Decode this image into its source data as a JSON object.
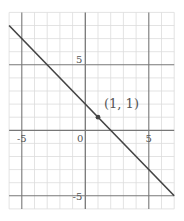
{
  "chart_data": {
    "type": "line",
    "title": "",
    "xlabel": "",
    "ylabel": "",
    "xlim": [
      -6,
      7
    ],
    "ylim": [
      -6,
      9
    ],
    "grid": true,
    "minor_grid_step": 1,
    "major_grid_step": 5,
    "x_ticks": [
      -5,
      0,
      5
    ],
    "y_ticks": [
      -5,
      5
    ],
    "x_tick_labels": [
      "-5",
      "0",
      "5"
    ],
    "y_tick_labels": [
      "-5",
      "5"
    ],
    "series": [
      {
        "name": "y = -x + 2",
        "x": [
          -6,
          7
        ],
        "y": [
          8,
          -5
        ],
        "color": "#444444"
      }
    ],
    "points": [
      {
        "x": 1,
        "y": 1,
        "label": "(1, 1)"
      }
    ],
    "legend": null
  },
  "colors": {
    "minor_grid": "#dcdcdc",
    "major_grid": "#777777",
    "line": "#444444",
    "text": "#555555"
  },
  "layout": {
    "x0_px": 85.3,
    "y0_px": 130.3,
    "px_per_unit_x": 12.7,
    "px_per_unit_y": 13.1
  }
}
